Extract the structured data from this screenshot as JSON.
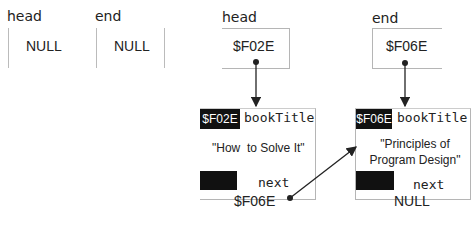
{
  "before": {
    "head": {
      "label": "head",
      "value": "NULL"
    },
    "end": {
      "label": "end",
      "value": "NULL"
    }
  },
  "after": {
    "head": {
      "label": "head",
      "value": "$F02E"
    },
    "end": {
      "label": "end",
      "value": "$F06E"
    },
    "nodes": [
      {
        "address": "$F02E",
        "field_label": "bookTitle",
        "title": "\"How  to Solve It\"",
        "next_label": "next",
        "next_value": "$F06E"
      },
      {
        "address": "$F06E",
        "field_label": "bookTitle",
        "title_line1": "\"Principles of",
        "title_line2": "Program Design\"",
        "next_label": "next",
        "next_value": "NULL"
      }
    ]
  },
  "colors": {
    "line": "#b5b5b5",
    "arrow": "#222222",
    "block": "#111111"
  }
}
